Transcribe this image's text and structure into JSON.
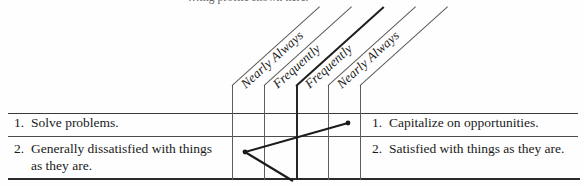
{
  "figure": {
    "caption_partial": "…ing profile shown here.",
    "scale_labels": [
      {
        "id": "col-1",
        "text": "Nearly Always"
      },
      {
        "id": "col-2",
        "text": "Frequently"
      },
      {
        "id": "col-3",
        "text": "Frequently"
      },
      {
        "id": "col-4",
        "text": "Nearly Always"
      }
    ],
    "left_items": [
      {
        "number": "1.",
        "text": "Solve problems."
      },
      {
        "number": "2.",
        "text": "Generally dissatisfied with things as they are."
      }
    ],
    "right_items": [
      {
        "number": "1.",
        "text": "Capitalize on opportunities."
      },
      {
        "number": "2.",
        "text": "Satisfied with things as they are."
      }
    ],
    "colors": {
      "ink": "#1a1a1a",
      "rule": "#2b2b2b",
      "grid": "#5c5c5c",
      "plot": "#1b1b1b",
      "paper": "#fefefe"
    },
    "grid": {
      "vertical_line_x": [
        232,
        264,
        296,
        328,
        360
      ],
      "row_rule_y": [
        113,
        136,
        178
      ]
    },
    "plot": {
      "type": "profile-line",
      "points": [
        {
          "x": 348,
          "y": 123,
          "marker": "dot"
        },
        {
          "x": 245,
          "y": 152,
          "marker": "dot"
        },
        {
          "x": 293,
          "y": 181,
          "marker": "none"
        }
      ]
    }
  }
}
